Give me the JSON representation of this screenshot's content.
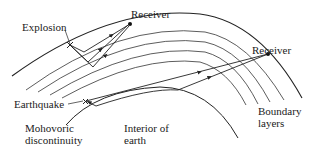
{
  "figure": {
    "type": "seismic-ray-diagram",
    "labels": {
      "explosion": "Explosion",
      "receiver_top": "Receiver",
      "receiver_right": "Receiver",
      "earthquake": "Earthquake",
      "boundary_layers_line1": "Boundary",
      "boundary_layers_line2": "layers",
      "mohovoric_line1": "Mohovoric",
      "mohovoric_line2": "discontinuity",
      "interior_line1": "Interior of",
      "interior_line2": "earth"
    },
    "colors": {
      "line": "#222222",
      "background": "#ffffff"
    }
  }
}
